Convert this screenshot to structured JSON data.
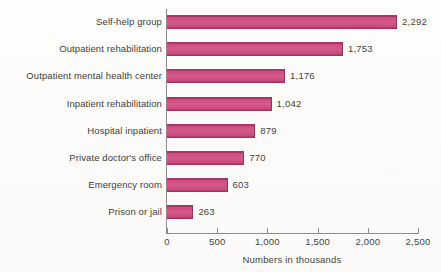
{
  "chart_data": {
    "type": "bar",
    "orientation": "horizontal",
    "title": "",
    "xlabel": "Numbers in thousands",
    "ylabel": "",
    "xlim": [
      0,
      2500
    ],
    "xticks": [
      "0",
      "500",
      "1,000",
      "1,500",
      "2,000",
      "2,500"
    ],
    "xtick_values": [
      0,
      500,
      1000,
      1500,
      2000,
      2500
    ],
    "grid": false,
    "legend": null,
    "categories": [
      "Self-help group",
      "Outpatient rehabilitation",
      "Outpatient mental health center",
      "Inpatient rehabilitation",
      "Hospital inpatient",
      "Private doctor's office",
      "Emergency room",
      "Prison or jail"
    ],
    "values": [
      2292,
      1753,
      1176,
      1042,
      879,
      770,
      603,
      263
    ],
    "value_labels": [
      "2,292",
      "1,753",
      "1,176",
      "1,042",
      "879",
      "770",
      "603",
      "263"
    ],
    "bar_color": "#cf4d81",
    "bar_edge_color": "#a33060",
    "axis_color": "#8e8d8b",
    "background_color": "#fdfcfb"
  }
}
